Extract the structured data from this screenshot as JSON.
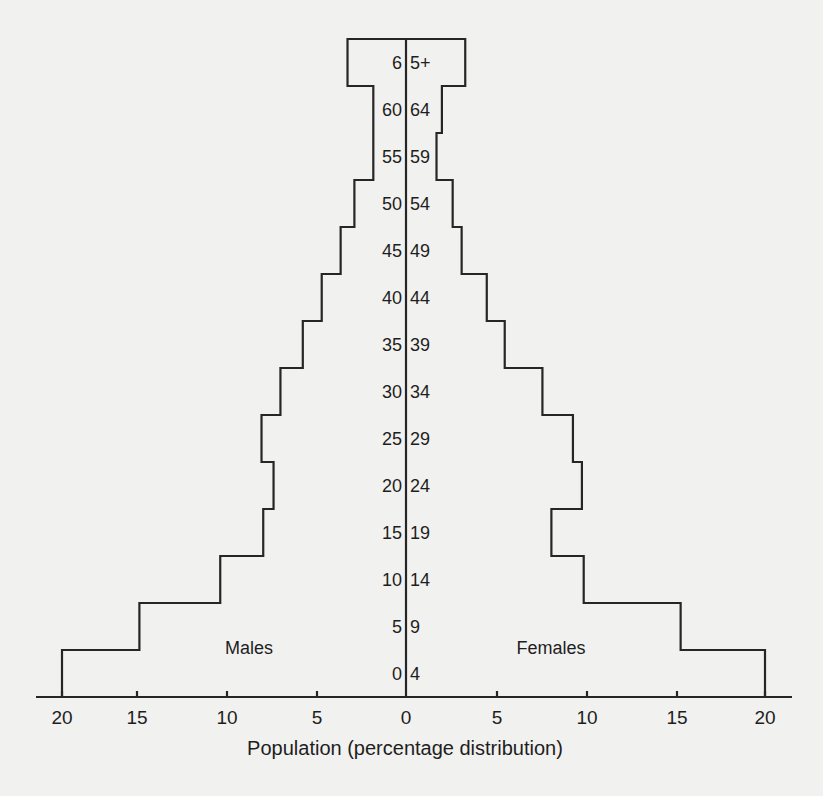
{
  "chart_data": {
    "type": "bar",
    "subtype": "population-pyramid",
    "title": "",
    "xlabel": "Population (percentage distribution)",
    "ylabel": "",
    "x_ticks_left": [
      "20",
      "15",
      "10",
      "5",
      "0"
    ],
    "x_ticks_right": [
      "5",
      "10",
      "15",
      "20"
    ],
    "xlim": [
      0,
      20
    ],
    "grid": false,
    "legend": null,
    "side_labels": {
      "left": "Males",
      "right": "Females"
    },
    "categories": [
      "0 4",
      "5 9",
      "10 14",
      "15 19",
      "20 24",
      "25 29",
      "30 34",
      "35 39",
      "40 44",
      "45 49",
      "50 54",
      "55 59",
      "60 64",
      "65+"
    ],
    "age_label_left": [
      "0",
      "5",
      "10",
      "15",
      "20",
      "25",
      "30",
      "35",
      "40",
      "45",
      "50",
      "55",
      "60",
      "6"
    ],
    "age_label_right": [
      "4",
      "9",
      "14",
      "19",
      "24",
      "29",
      "34",
      "39",
      "44",
      "49",
      "54",
      "59",
      "64",
      "5+"
    ],
    "series": [
      {
        "name": "Males",
        "values": [
          20.0,
          15.5,
          10.8,
          8.3,
          7.7,
          8.4,
          7.3,
          6.0,
          4.9,
          3.8,
          3.0,
          1.9,
          1.9,
          3.4
        ]
      },
      {
        "name": "Females",
        "values": [
          20.0,
          15.3,
          9.9,
          8.1,
          9.8,
          9.3,
          7.6,
          5.5,
          4.5,
          3.1,
          2.6,
          1.7,
          2.0,
          3.3
        ]
      }
    ]
  },
  "labels": {
    "males": "Males",
    "females": "Females",
    "xlabel": "Population (percentage distribution)"
  }
}
